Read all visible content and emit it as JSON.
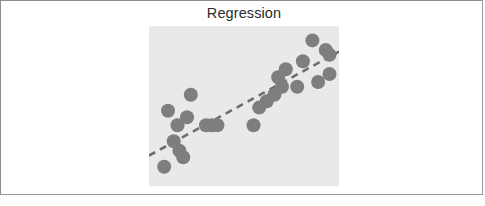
{
  "figure": {
    "title": "Regression",
    "background_color": "#ffffff",
    "border_color": "#9a9a9a",
    "plot_background_color": "#e9e9e9"
  },
  "chart_data": {
    "type": "scatter",
    "title": "Regression",
    "xlabel": "",
    "ylabel": "",
    "xlim": [
      0,
      100
    ],
    "ylim": [
      0,
      100
    ],
    "grid": false,
    "legend": null,
    "point_color": "#7e7e7e",
    "point_radius": 7,
    "series": [
      {
        "name": "observations",
        "x": [
          22,
          20,
          10,
          15,
          13,
          16,
          18,
          8,
          30,
          33,
          36,
          55,
          58,
          62,
          66,
          68,
          70,
          72,
          78,
          81,
          86,
          89,
          93,
          95,
          95
        ],
        "y": [
          57,
          43,
          47,
          38,
          28,
          22,
          18,
          12,
          38,
          38,
          38,
          38,
          49,
          53,
          57,
          68,
          62,
          73,
          62,
          78,
          91,
          65,
          85,
          82,
          70
        ]
      }
    ],
    "trendline": {
      "name": "regression-line",
      "style": "dashed",
      "color": "#6d6d6d",
      "x": [
        0,
        100
      ],
      "y": [
        19,
        84
      ]
    }
  }
}
